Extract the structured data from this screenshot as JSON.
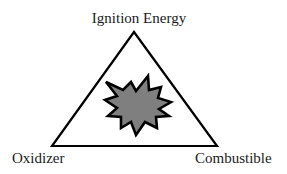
{
  "diagram": {
    "type": "fire-triangle",
    "vertices": {
      "top": {
        "label": "Ignition Energy"
      },
      "bottom_left": {
        "label": "Oxidizer"
      },
      "bottom_right": {
        "label": "Combustible"
      }
    },
    "center_icon": "explosion-burst-icon",
    "colors": {
      "stroke": "#000000",
      "burst_fill": "#808080",
      "background": "#ffffff",
      "text": "#1a1a1a"
    }
  }
}
